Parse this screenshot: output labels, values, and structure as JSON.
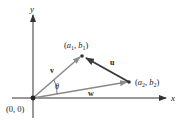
{
  "diagram": {
    "axes": {
      "x_label": "x",
      "y_label": "y"
    },
    "origin_label": "(0, 0)",
    "points": [
      {
        "id": "p1",
        "label_a": "a",
        "label_sub_a": "1",
        "label_b": "b",
        "label_sub_b": "1"
      },
      {
        "id": "p2",
        "label_a": "a",
        "label_sub_a": "2",
        "label_b": "b",
        "label_sub_b": "2"
      }
    ],
    "vectors": [
      {
        "name": "v",
        "from": "origin",
        "to": "(a1, b1)",
        "color": "#8a8a8a"
      },
      {
        "name": "w",
        "from": "origin",
        "to": "(a2, b2)",
        "color": "#8a8a8a"
      },
      {
        "name": "u",
        "from": "(a2, b2)",
        "to": "(a1, b1)",
        "color": "#3a3a3a"
      }
    ],
    "angle_label": "θ",
    "colors": {
      "axis": "#333333",
      "vector_light": "#8a8a8a",
      "vector_dark": "#3a3a3a",
      "point": "#333333"
    }
  }
}
